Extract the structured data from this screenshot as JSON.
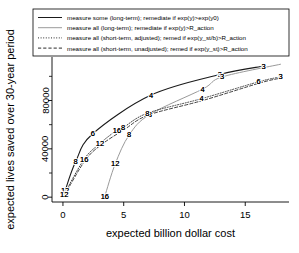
{
  "chart_data": {
    "type": "line",
    "title": "",
    "xlabel": "expected billion dollar cost",
    "ylabel": "expected lives saved over 30-year period",
    "xlim": [
      -0.9,
      18.6
    ],
    "ylim": [
      -4000,
      116000
    ],
    "xticks": [
      0,
      5,
      10,
      15
    ],
    "xtick_labels": [
      "0",
      "5",
      "10",
      "15"
    ],
    "yticks": [
      0,
      40000,
      80000
    ],
    "ytick_labels": [
      "0",
      "40000",
      "80000"
    ],
    "y_minor_ticks": [
      20000,
      60000,
      100000
    ],
    "grid": false,
    "legend_position": "top",
    "series": [
      {
        "name": "measure some (long-term); remediate if exp(y)>exp(y0)",
        "style": "solid",
        "color": "#1a1a1a",
        "width": 1.1,
        "points": [
          {
            "x": 0.12,
            "y": 1000,
            "label": "16"
          },
          {
            "x": 0.18,
            "y": 5200,
            "label": "12"
          },
          {
            "x": 1.05,
            "y": 29500,
            "label": "8"
          },
          {
            "x": 2.45,
            "y": 52500,
            "label": "6"
          },
          {
            "x": 7.25,
            "y": 84500,
            "label": "4"
          },
          {
            "x": 12.9,
            "y": 101500,
            "label": "3"
          },
          {
            "x": 16.5,
            "y": 108500,
            "label": "3"
          }
        ]
      },
      {
        "name": "measure all (long-term); remediate if exp(y)>R_action",
        "style": "solid",
        "color": "#9a9a9a",
        "width": 1.0,
        "points": [
          {
            "x": 3.45,
            "y": 900,
            "label": "16"
          },
          {
            "x": 4.3,
            "y": 27500,
            "label": "12"
          },
          {
            "x": 5.45,
            "y": 51500,
            "label": "8"
          },
          {
            "x": 7.15,
            "y": 68500,
            "label": "8"
          },
          {
            "x": 11.5,
            "y": 89500,
            "label": "4"
          },
          {
            "x": 13.1,
            "y": 99500,
            "label": "3"
          },
          {
            "x": 17.9,
            "y": 110000,
            "label": ""
          }
        ]
      },
      {
        "name": "measure all (short-term, adjusted); remed if exp(y_st/b)>R_action",
        "style": "dotted",
        "color": "#2b2b2b",
        "width": 0.9,
        "points": [
          {
            "x": 0.1,
            "y": 2400,
            "label": "12"
          },
          {
            "x": 1.75,
            "y": 31500,
            "label": "16"
          },
          {
            "x": 3.05,
            "y": 44500,
            "label": "12"
          },
          {
            "x": 4.45,
            "y": 55500,
            "label": "16"
          },
          {
            "x": 4.95,
            "y": 57500,
            "label": "8"
          },
          {
            "x": 6.95,
            "y": 69500,
            "label": "8"
          },
          {
            "x": 11.4,
            "y": 81500,
            "label": "4"
          },
          {
            "x": 16.1,
            "y": 95500,
            "label": "6"
          },
          {
            "x": 17.9,
            "y": 99500,
            "label": "3"
          }
        ]
      },
      {
        "name": "measure all (short-term, unadjusted); remed if exp(y_st)>R_action",
        "style": "dashed",
        "color": "#2b2b2b",
        "width": 0.9,
        "points": [
          {
            "x": 0.14,
            "y": 2000,
            "label": ""
          },
          {
            "x": 1.8,
            "y": 30000,
            "label": ""
          },
          {
            "x": 3.1,
            "y": 43000,
            "label": ""
          },
          {
            "x": 5.05,
            "y": 56000,
            "label": ""
          },
          {
            "x": 7.05,
            "y": 68000,
            "label": ""
          },
          {
            "x": 11.5,
            "y": 80000,
            "label": ""
          },
          {
            "x": 16.2,
            "y": 94500,
            "label": ""
          },
          {
            "x": 17.9,
            "y": 98500,
            "label": ""
          }
        ]
      }
    ]
  },
  "legend": {
    "entries": [
      {
        "label": "measure some (long-term); remediate if exp(y)>exp(y0)",
        "style": "solid",
        "color": "#1a1a1a"
      },
      {
        "label": "measure all (long-term); remediate if exp(y)>R_action",
        "style": "solid",
        "color": "#9a9a9a"
      },
      {
        "label": "measure all (short-term, adjusted); remed if exp(y_st/b)>R_action",
        "style": "dotted",
        "color": "#2b2b2b"
      },
      {
        "label": "measure all (short-term, unadjusted); remed if exp(y_st)>R_action",
        "style": "dashed",
        "color": "#2b2b2b"
      }
    ]
  },
  "axes": {
    "x_label": "expected billion dollar cost",
    "y_label": "expected lives saved over 30-year period",
    "x_tick_labels": [
      "0",
      "5",
      "10",
      "15"
    ],
    "y_tick_labels": [
      "0",
      "40000",
      "80000"
    ]
  }
}
